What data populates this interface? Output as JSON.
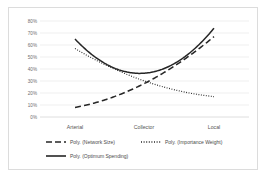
{
  "chart_data": {
    "type": "line",
    "title": "",
    "xlabel": "",
    "ylabel": "",
    "categories": [
      "Arterial",
      "Collector",
      "Local"
    ],
    "x": [
      0,
      1,
      2
    ],
    "ylim": [
      0,
      0.8
    ],
    "ytick_labels": [
      "80%",
      "70%",
      "60%",
      "50%",
      "40%",
      "30%",
      "20%",
      "10%",
      "0%"
    ],
    "ytick_values": [
      0.8,
      0.7,
      0.6,
      0.5,
      0.4,
      0.3,
      0.2,
      0.1,
      0.0
    ],
    "grid": "horizontal",
    "legend_position": "bottom",
    "series": [
      {
        "name": "Poly. (Network Size)",
        "style": "dashed",
        "color": "#262626",
        "values": [
          0.08,
          0.28,
          0.67
        ]
      },
      {
        "name": "Poly. (Importance Weight)",
        "style": "dotted",
        "color": "#262626",
        "values": [
          0.57,
          0.3,
          0.17
        ]
      },
      {
        "name": "Poly. (Optimum Spending)",
        "style": "solid",
        "color": "#262626",
        "values": [
          0.65,
          0.365,
          0.74
        ]
      }
    ]
  },
  "axis": {
    "y": {
      "t80": "80%",
      "t70": "70%",
      "t60": "60%",
      "t50": "50%",
      "t40": "40%",
      "t30": "30%",
      "t20": "20%",
      "t10": "10%",
      "t0": "0%"
    },
    "x": {
      "c0": "Arterial",
      "c1": "Collector",
      "c2": "Local"
    }
  },
  "legend": {
    "items": [
      {
        "label": "Poly. (Network Size)",
        "style": "dashed"
      },
      {
        "label": "Poly. (Importance Weight)",
        "style": "dotted"
      },
      {
        "label": "Poly. (Optimum Spending)",
        "style": "solid"
      }
    ]
  }
}
